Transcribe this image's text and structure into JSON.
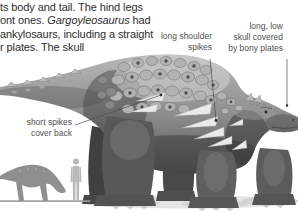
{
  "colors": {
    "background": "#ffffff",
    "body_text": "#2e2e2e",
    "label_text": "#4f4f4f",
    "leader_line": "#4d4d4d"
  },
  "paragraph": {
    "line1": "ts body and tail. The hind legs",
    "line2_prefix": "ont ones. ",
    "line2_italic": "Gargoyleosaurus",
    "line2_suffix": " had",
    "line3": "ankylosaurs, including a straight",
    "line4": "r plates. The skull"
  },
  "callouts": {
    "shoulder_spikes": {
      "lines": [
        "long shoulder",
        "spikes"
      ]
    },
    "skull": {
      "lines": [
        "long, low",
        "skull covered",
        "by bony plates"
      ]
    },
    "back_spikes": {
      "lines": [
        "short spikes",
        "cover back"
      ]
    }
  }
}
